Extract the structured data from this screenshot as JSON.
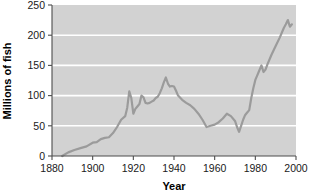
{
  "chart_data": {
    "type": "line",
    "title": "",
    "xlabel": "Year",
    "ylabel": "Millions of fish",
    "xlim": [
      1880,
      2000
    ],
    "ylim": [
      0,
      250
    ],
    "xticks": [
      1880,
      1900,
      1920,
      1940,
      1960,
      1980,
      2000
    ],
    "xtick_labels": [
      "1880",
      "1900",
      "1920",
      "1940",
      "1960",
      "1980",
      "2000"
    ],
    "yticks": [
      0,
      50,
      100,
      150,
      200,
      250
    ],
    "ytick_labels": [
      "0",
      "50",
      "100",
      "150",
      "200",
      "250"
    ],
    "grid": "horizontal-white",
    "legend": "none",
    "plot_background": "#d2d2d2",
    "line_color": "#9b9b9b",
    "series": [
      {
        "name": "Millions of fish",
        "x": [
          1885,
          1888,
          1891,
          1894,
          1897,
          1900,
          1902,
          1904,
          1906,
          1908,
          1910,
          1912,
          1914,
          1916,
          1917,
          1918,
          1919,
          1920,
          1921,
          1922,
          1923,
          1924,
          1925,
          1926,
          1927,
          1928,
          1929,
          1930,
          1931,
          1932,
          1933,
          1934,
          1935,
          1936,
          1937,
          1938,
          1939,
          1940,
          1941,
          1942,
          1944,
          1946,
          1948,
          1950,
          1952,
          1954,
          1956,
          1958,
          1960,
          1962,
          1964,
          1966,
          1968,
          1970,
          1971,
          1972,
          1973,
          1974,
          1975,
          1976,
          1977,
          1978,
          1979,
          1980,
          1981,
          1982,
          1983,
          1984,
          1985,
          1986,
          1988,
          1990,
          1992,
          1994,
          1995,
          1996,
          1997,
          1998
        ],
        "y": [
          0,
          6,
          10,
          13,
          16,
          22,
          23,
          28,
          30,
          31,
          38,
          48,
          60,
          66,
          80,
          107,
          96,
          70,
          78,
          82,
          86,
          100,
          97,
          88,
          87,
          88,
          90,
          92,
          96,
          98,
          104,
          112,
          122,
          130,
          120,
          115,
          116,
          115,
          108,
          100,
          93,
          88,
          84,
          78,
          70,
          60,
          48,
          50,
          52,
          56,
          62,
          70,
          66,
          58,
          48,
          40,
          50,
          60,
          68,
          72,
          76,
          96,
          112,
          126,
          134,
          142,
          150,
          139,
          143,
          152,
          168,
          182,
          196,
          212,
          218,
          225,
          214,
          218
        ]
      }
    ]
  }
}
